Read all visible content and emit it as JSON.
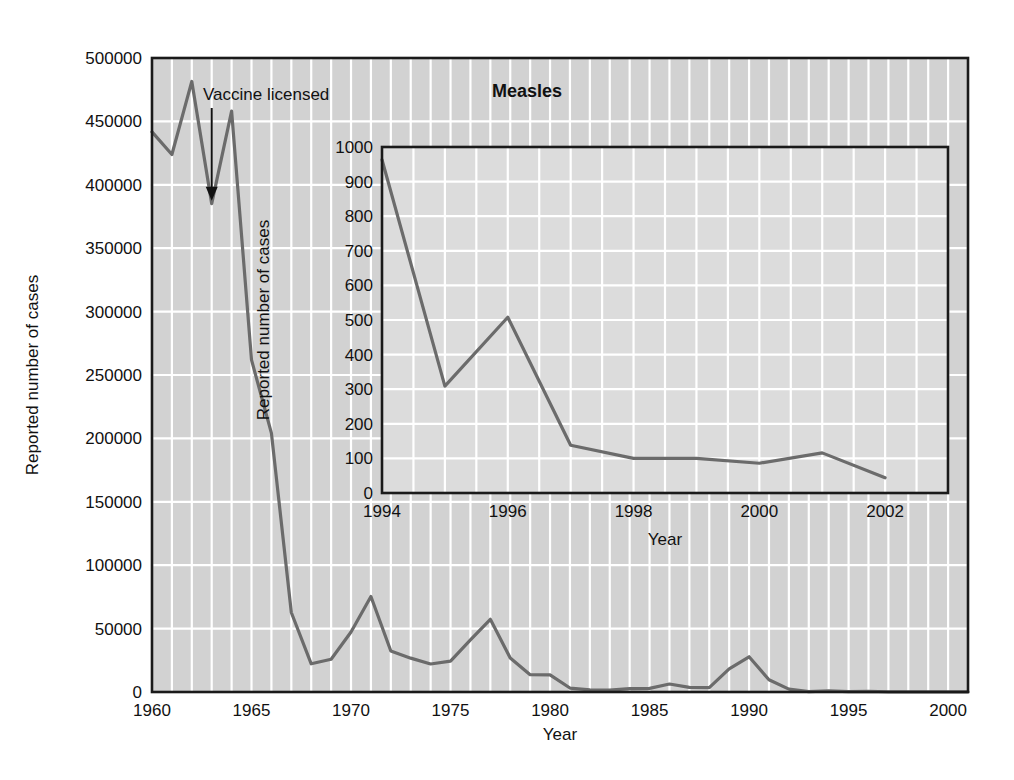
{
  "figure": {
    "title": "Measles",
    "background_color": "#ffffff",
    "plot_fill": "#d2d2d2",
    "inset_fill": "#dcdcdc",
    "gridline_color": "#ffffff",
    "line_color": "#6b6b6b",
    "axis_color": "#1a1a1a"
  },
  "main_chart": {
    "ylabel": "Reported number of cases",
    "xlabel": "Year",
    "y_ticks": [
      "0",
      "50000",
      "100000",
      "150000",
      "200000",
      "250000",
      "300000",
      "350000",
      "400000",
      "450000",
      "500000"
    ],
    "x_ticks": [
      "1960",
      "1965",
      "1970",
      "1975",
      "1980",
      "1985",
      "1990",
      "1995",
      "2000"
    ],
    "annotation": "Vaccine licensed",
    "annotation_year": 1963
  },
  "inset_chart": {
    "ylabel": "Reported number of cases",
    "xlabel": "Year",
    "y_ticks": [
      "0",
      "100",
      "200",
      "300",
      "400",
      "500",
      "600",
      "700",
      "800",
      "900",
      "1000"
    ],
    "x_ticks": [
      "1994",
      "1996",
      "1998",
      "2000",
      "2002"
    ]
  },
  "chart_data": [
    {
      "type": "line",
      "id": "main",
      "title": "Measles",
      "xlabel": "Year",
      "ylabel": "Reported number of cases",
      "xlim": [
        1960,
        2001
      ],
      "ylim": [
        0,
        500000
      ],
      "grid": true,
      "legend": "none",
      "annotations": [
        {
          "text": "Vaccine licensed",
          "x": 1963,
          "y": 385000
        }
      ],
      "x": [
        1960,
        1961,
        1962,
        1963,
        1964,
        1965,
        1966,
        1967,
        1968,
        1969,
        1970,
        1971,
        1972,
        1973,
        1974,
        1975,
        1976,
        1977,
        1978,
        1979,
        1980,
        1981,
        1982,
        1983,
        1984,
        1985,
        1986,
        1987,
        1988,
        1989,
        1990,
        1991,
        1992,
        1993,
        1994,
        1995,
        1996,
        1997,
        1998,
        1999,
        2000,
        2001
      ],
      "values": [
        441703,
        423919,
        481530,
        385156,
        458083,
        261904,
        204136,
        62705,
        22231,
        25826,
        47351,
        75290,
        32275,
        26690,
        22094,
        24374,
        41126,
        57345,
        26871,
        13597,
        13506,
        3124,
        1714,
        1497,
        2587,
        2822,
        6282,
        3655,
        3396,
        18193,
        27786,
        9643,
        2237,
        312,
        963,
        309,
        508,
        138,
        100,
        100,
        86,
        116
      ]
    },
    {
      "type": "line",
      "id": "inset",
      "title": "",
      "xlabel": "Year",
      "ylabel": "Reported number of cases",
      "xlim": [
        1994,
        2003
      ],
      "ylim": [
        0,
        1000
      ],
      "grid": true,
      "legend": "none",
      "x": [
        1994,
        1995,
        1996,
        1997,
        1998,
        1999,
        2000,
        2001,
        2002
      ],
      "values": [
        963,
        309,
        508,
        138,
        100,
        100,
        86,
        116,
        44
      ]
    }
  ]
}
